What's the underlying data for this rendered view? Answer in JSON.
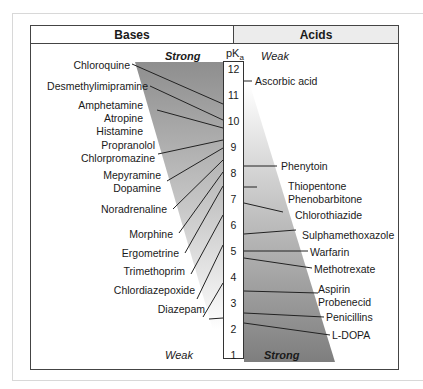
{
  "header": {
    "bases": "Bases",
    "acids": "Acids"
  },
  "scale": {
    "title": "pK",
    "subscript": "a",
    "ticks": [
      "12",
      "11",
      "10",
      "9",
      "8",
      "7",
      "6",
      "5",
      "4",
      "3",
      "2",
      "1"
    ]
  },
  "bases": {
    "strong_label": "Strong",
    "weak_label": "Weak",
    "drugs": [
      {
        "name": "Chloroquine",
        "pka": 10.8
      },
      {
        "name": "Desmethylimipramine",
        "pka": 10.2
      },
      {
        "name": "Amphetamine",
        "pka": 9.9
      },
      {
        "name": "Atropine",
        "pka": 9.9
      },
      {
        "name": "Histamine",
        "pka": 9.9
      },
      {
        "name": "Propranolol",
        "pka": 9.4
      },
      {
        "name": "Chlorpromazine",
        "pka": 9.3
      },
      {
        "name": "Mepyramine",
        "pka": 8.9
      },
      {
        "name": "Dopamine",
        "pka": 8.8
      },
      {
        "name": "Noradrenaline",
        "pka": 8.6
      },
      {
        "name": "Morphine",
        "pka": 7.9
      },
      {
        "name": "Ergometrine",
        "pka": 6.8
      },
      {
        "name": "Trimethoprim",
        "pka": 7.2
      },
      {
        "name": "Chlordiazepoxide",
        "pka": 4.6
      },
      {
        "name": "Diazepam",
        "pka": 3.3
      }
    ]
  },
  "acids": {
    "weak_label": "Weak",
    "strong_label": "Strong",
    "drugs": [
      {
        "name": "Ascorbic acid",
        "pka": 11.5
      },
      {
        "name": "Phenytoin",
        "pka": 8.3
      },
      {
        "name": "Thiopentone",
        "pka": 7.6
      },
      {
        "name": "Phenobarbitone",
        "pka": 7.4
      },
      {
        "name": "Chlorothiazide",
        "pka": 6.8
      },
      {
        "name": "Sulphamethoxazole",
        "pka": 5.6
      },
      {
        "name": "Warfarin",
        "pka": 5.1
      },
      {
        "name": "Methotrexate",
        "pka": 4.8
      },
      {
        "name": "Aspirin",
        "pka": 3.5
      },
      {
        "name": "Probenecid",
        "pka": 3.4
      },
      {
        "name": "Penicillins",
        "pka": 2.7
      },
      {
        "name": "L-DOPA",
        "pka": 2.3
      }
    ]
  },
  "colors": {
    "strong_gray": "#8c8c8c",
    "weak_gray": "#f2f2f2",
    "line": "#222222"
  }
}
